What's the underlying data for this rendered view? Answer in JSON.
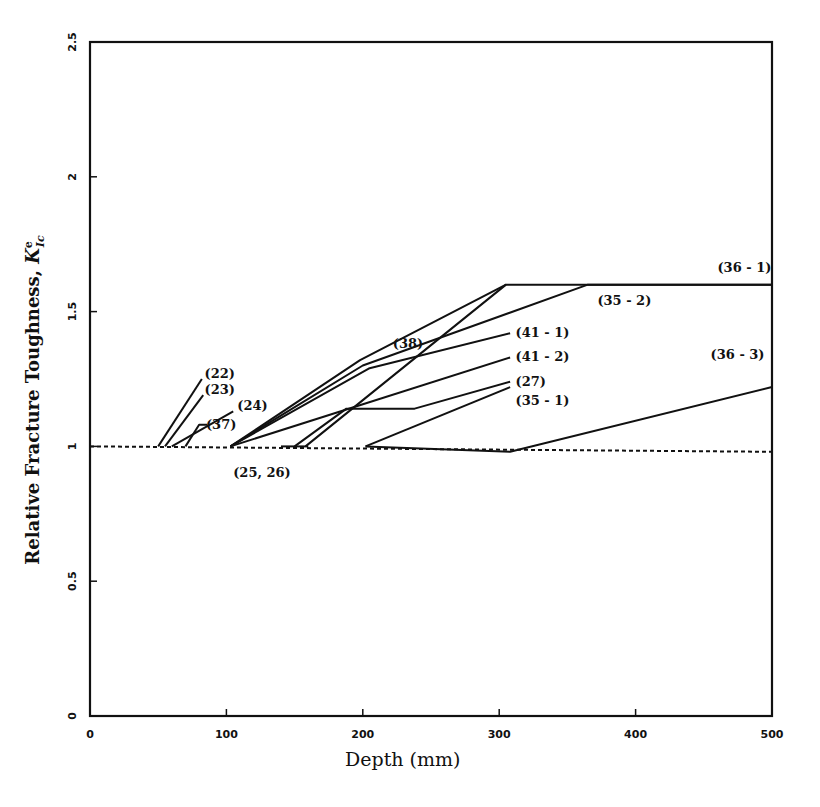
{
  "chart_data": {
    "type": "line",
    "title": "",
    "xlabel": "Depth (mm)",
    "ylabel": "Relative Fracture Toughness, K'Ic",
    "ylabel_main": "Relative Fracture Toughness,",
    "ylabel_symbol": "K",
    "ylabel_sup": "e",
    "ylabel_sub": "Ic",
    "xlim": [
      0,
      500
    ],
    "ylim": [
      0,
      2.5
    ],
    "x_ticks": [
      "0",
      "100",
      "200",
      "300",
      "400",
      "500"
    ],
    "y_ticks": [
      "0",
      "0.5",
      "1",
      "1.5",
      "2",
      "2.5"
    ],
    "grid": false,
    "legend": "inline labels",
    "baseline": {
      "name": "baseline",
      "style": "dashed",
      "points": [
        [
          0,
          1.0
        ],
        [
          500,
          0.98
        ]
      ]
    },
    "series": [
      {
        "name": "(22)",
        "points": [
          [
            50,
            1.0
          ],
          [
            82,
            1.25
          ]
        ]
      },
      {
        "name": "(23)",
        "points": [
          [
            55,
            1.0
          ],
          [
            83,
            1.19
          ]
        ]
      },
      {
        "name": "(24)",
        "points": [
          [
            60,
            1.0
          ],
          [
            105,
            1.13
          ]
        ]
      },
      {
        "name": "(37)",
        "points": [
          [
            70,
            1.0
          ],
          [
            80,
            1.08
          ],
          [
            86,
            1.08
          ]
        ]
      },
      {
        "name": "(38)",
        "points": [
          [
            103,
            1.0
          ],
          [
            198,
            1.32
          ],
          [
            305,
            1.6
          ]
        ]
      },
      {
        "name": "(35 - 2)",
        "points": [
          [
            103,
            1.0
          ],
          [
            200,
            1.3
          ],
          [
            365,
            1.6
          ],
          [
            500,
            1.6
          ]
        ]
      },
      {
        "name": "(41 - 1)",
        "points": [
          [
            103,
            1.0
          ],
          [
            205,
            1.29
          ],
          [
            308,
            1.42
          ]
        ]
      },
      {
        "name": "(41 - 2)",
        "points": [
          [
            103,
            1.0
          ],
          [
            308,
            1.33
          ]
        ]
      },
      {
        "name": "(27)",
        "points": [
          [
            150,
            1.0
          ],
          [
            188,
            1.14
          ],
          [
            238,
            1.14
          ],
          [
            308,
            1.24
          ]
        ]
      },
      {
        "name": "(36 - 1)",
        "points": [
          [
            158,
            1.0
          ],
          [
            305,
            1.6
          ],
          [
            500,
            1.6
          ]
        ]
      },
      {
        "name": "(35 - 1)",
        "points": [
          [
            202,
            1.0
          ],
          [
            308,
            1.22
          ]
        ]
      },
      {
        "name": "(36 - 3)",
        "points": [
          [
            202,
            1.0
          ],
          [
            308,
            0.98
          ],
          [
            500,
            1.22
          ]
        ]
      },
      {
        "name": "(25, 26)",
        "points": [
          [
            140,
            1.0
          ],
          [
            160,
            1.0
          ]
        ]
      }
    ],
    "annotations": [
      {
        "text": "(22)",
        "x": 84,
        "y": 1.27
      },
      {
        "text": "(23)",
        "x": 84,
        "y": 1.21
      },
      {
        "text": "(24)",
        "x": 108,
        "y": 1.15
      },
      {
        "text": "(37)",
        "x": 85,
        "y": 1.08
      },
      {
        "text": "(25, 26)",
        "x": 105,
        "y": 0.9
      },
      {
        "text": "(38)",
        "x": 222,
        "y": 1.38
      },
      {
        "text": "(41 - 1)",
        "x": 312,
        "y": 1.42
      },
      {
        "text": "(41 - 2)",
        "x": 312,
        "y": 1.33
      },
      {
        "text": "(27)",
        "x": 312,
        "y": 1.24
      },
      {
        "text": "(35 - 1)",
        "x": 312,
        "y": 1.17
      },
      {
        "text": "(36 - 1)",
        "x": 460,
        "y": 1.66
      },
      {
        "text": "(35 - 2)",
        "x": 372,
        "y": 1.54
      },
      {
        "text": "(36 - 3)",
        "x": 455,
        "y": 1.34
      }
    ]
  }
}
